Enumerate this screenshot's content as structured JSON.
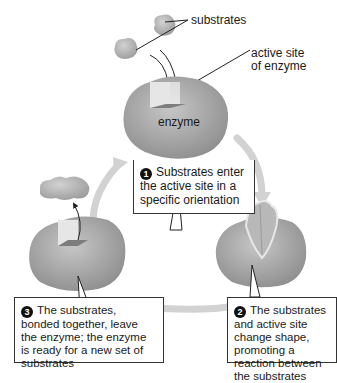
{
  "diagram": {
    "labels": {
      "substrates": "substrates",
      "active_site_line1": "active site",
      "active_site_line2": "of enzyme",
      "enzyme": "enzyme"
    },
    "steps": [
      {
        "number": "1",
        "text": "Substrates enter the active site in a specific orientation"
      },
      {
        "number": "2",
        "text": "The substrates and active site change shape, promoting a reaction between the substrates"
      },
      {
        "number": "3",
        "text": "The substrates, bonded together, leave the enzyme; the enzyme is ready for a new set of substrates"
      }
    ],
    "colors": {
      "enzyme_fill": "#a8a8a8",
      "substrate_fill": "#b5b5b5",
      "cycle_arrow": "#d0d0d0",
      "box_border": "#333333"
    }
  }
}
